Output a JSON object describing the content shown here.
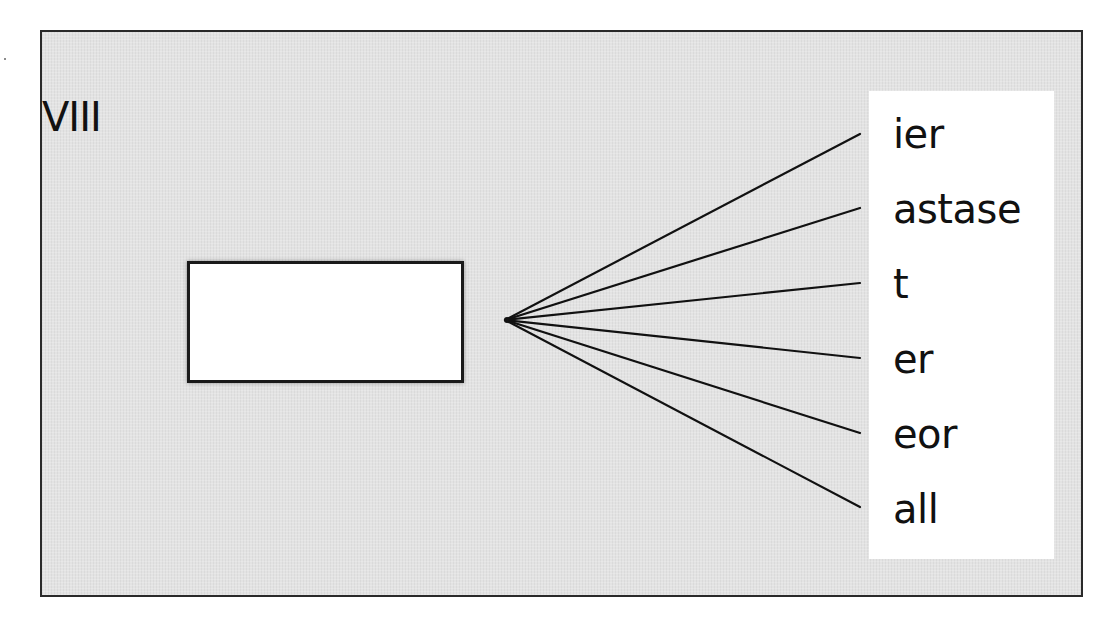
{
  "diagram": {
    "title": "VIII",
    "empty_box": {
      "text": ""
    },
    "hub_point": {
      "x": 505,
      "y": 320
    },
    "labels": [
      {
        "text": "ier",
        "line_end_y": 134,
        "top": 114
      },
      {
        "text": "astase",
        "line_end_y": 208,
        "top": 189
      },
      {
        "text": "t",
        "line_end_y": 283,
        "top": 264
      },
      {
        "text": "er",
        "line_end_y": 358,
        "top": 339
      },
      {
        "text": "eor",
        "line_end_y": 433,
        "top": 414
      },
      {
        "text": "all",
        "line_end_y": 507,
        "top": 489
      }
    ],
    "colors": {
      "frame_background": "#e3e3e3",
      "frame_border": "#2a2a2a",
      "panel_background": "#ffffff",
      "text": "#111111",
      "lines": "#111111"
    }
  }
}
